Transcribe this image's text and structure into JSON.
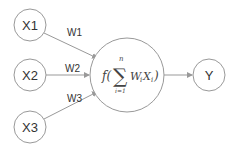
{
  "diagram": {
    "inputs": [
      {
        "label": "X1",
        "weight": "W1"
      },
      {
        "label": "X2",
        "weight": "W2"
      },
      {
        "label": "X3",
        "weight": "W3"
      }
    ],
    "neuron": {
      "func": "f(",
      "sum_symbol": "∑",
      "upper_limit": "n",
      "lower_limit": "i=1",
      "term": "W",
      "term_sub": "i",
      "term2": "X",
      "term2_sub": "i",
      "close": ")"
    },
    "output": {
      "label": "Y"
    },
    "colors": {
      "stroke": "#999999",
      "text": "#333333"
    }
  }
}
